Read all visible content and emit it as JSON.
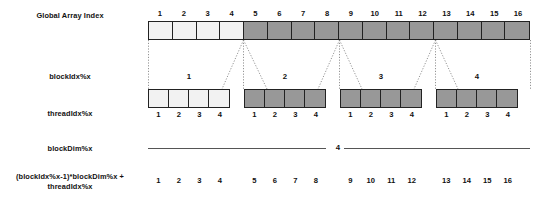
{
  "figure": {
    "colors": {
      "light_cell": "#f2f2f2",
      "dark_cell": "#989898",
      "stroke": "#222222",
      "line": "#555555",
      "text": "#111111",
      "background": "#ffffff"
    }
  },
  "rows": {
    "global_array": {
      "label": "Global Array Index",
      "ticks": [
        "1",
        "2",
        "3",
        "4",
        "5",
        "6",
        "7",
        "8",
        "9",
        "10",
        "11",
        "12",
        "13",
        "14",
        "15",
        "16"
      ],
      "shading": [
        "light",
        "light",
        "light",
        "light",
        "dark",
        "dark",
        "dark",
        "dark",
        "dark",
        "dark",
        "dark",
        "dark",
        "dark",
        "dark",
        "dark",
        "dark"
      ]
    },
    "block_idx": {
      "label": "blockIdx%x",
      "values": [
        "1",
        "2",
        "3",
        "4"
      ]
    },
    "thread_idx": {
      "label": "threadIdx%x",
      "blocks": [
        {
          "block": "1",
          "shading": "light",
          "ticks": [
            "1",
            "2",
            "3",
            "4"
          ]
        },
        {
          "block": "2",
          "shading": "dark",
          "ticks": [
            "1",
            "2",
            "3",
            "4"
          ]
        },
        {
          "block": "3",
          "shading": "dark",
          "ticks": [
            "1",
            "2",
            "3",
            "4"
          ]
        },
        {
          "block": "4",
          "shading": "dark",
          "ticks": [
            "1",
            "2",
            "3",
            "4"
          ]
        }
      ]
    },
    "block_dim": {
      "label": "blockDim%x",
      "value": "4"
    },
    "global_index_formula": {
      "label_line1": "(blockIdx%x-1)*blockDim%x +",
      "label_line2": "threadIdx%x",
      "groups": [
        [
          "1",
          "2",
          "3",
          "4"
        ],
        [
          "5",
          "6",
          "7",
          "8"
        ],
        [
          "9",
          "10",
          "11",
          "12"
        ],
        [
          "13",
          "14",
          "15",
          "16"
        ]
      ]
    }
  }
}
